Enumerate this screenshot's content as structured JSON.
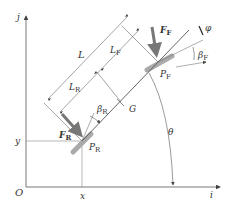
{
  "diagram": {
    "type": "vehicle-bicycle-model",
    "axes": {
      "origin_label": "O",
      "x_axis_label": "i",
      "y_axis_label": "j",
      "x_coord_label": "x",
      "y_coord_label": "y"
    },
    "points": {
      "rear": {
        "label": "P",
        "sub": "R"
      },
      "front": {
        "label": "P",
        "sub": "F"
      },
      "center_of_gravity": {
        "label": "G"
      }
    },
    "forces": {
      "rear": {
        "label": "F",
        "sub": "R"
      },
      "front": {
        "label": "F",
        "sub": "F"
      }
    },
    "dimensions": {
      "wheelbase": {
        "label": "L"
      },
      "rear_length": {
        "label": "L",
        "sub": "R"
      },
      "front_length": {
        "label": "L",
        "sub": "F"
      }
    },
    "angles": {
      "heading": {
        "label": "θ"
      },
      "rear_slip": {
        "label": "β",
        "sub": "R"
      },
      "front_slip": {
        "label": "β",
        "sub": "F"
      },
      "steering": {
        "label": "φ"
      }
    },
    "colors": {
      "line": "#555555",
      "thin_line": "#888888",
      "force_arrow": "#777777",
      "wheel": "#aaaaaa",
      "text": "#333333"
    }
  }
}
